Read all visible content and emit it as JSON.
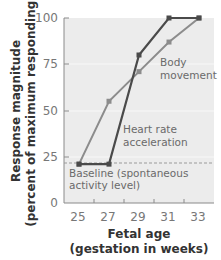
{
  "chart_data": {
    "type": "line",
    "title": "",
    "xlabel": "Fetal age (gestation in weeks)",
    "xlabel_lines": [
      "Fetal age",
      "(gestation in weeks)"
    ],
    "ylabel": "Response magnitude (percent of maximum responding)",
    "ylabel_lines": [
      "Response magnitude",
      "(percent of maximum responding)"
    ],
    "x_ticks": [
      25,
      27,
      29,
      31,
      33
    ],
    "y_ticks": [
      0,
      25,
      50,
      75,
      100
    ],
    "xlim": [
      24,
      34
    ],
    "ylim": [
      0,
      100
    ],
    "grid": true,
    "series": [
      {
        "name": "Heart rate acceleration",
        "label_lines": [
          "Heart rate",
          "acceleration"
        ],
        "color": "#4a4a4a",
        "x": [
          25,
          27,
          29,
          31,
          33
        ],
        "values": [
          21,
          21,
          80,
          100,
          100
        ]
      },
      {
        "name": "Body movement",
        "label_lines": [
          "Body",
          "movement"
        ],
        "color": "#8c8c8c",
        "x": [
          25,
          27,
          29,
          31,
          33
        ],
        "values": [
          21,
          55,
          71,
          87,
          100
        ]
      }
    ],
    "annotations": [
      {
        "text": "Baseline (spontaneous activity level)",
        "lines": [
          "Baseline (spontaneous",
          "activity level)"
        ],
        "type": "dashed-reference-line",
        "value": 21
      }
    ],
    "colors": {
      "plot_background": "#ececec",
      "grid": "#f8f8f8",
      "baseline_dash": "#9a9a9a"
    }
  }
}
